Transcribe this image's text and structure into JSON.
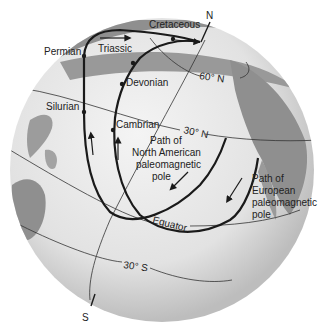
{
  "figure": {
    "type": "globe-polar-wander-diagram",
    "colors": {
      "ocean": "#e6e6e6",
      "land": "#8f8f8f",
      "grid_lines": "#333333",
      "paths": "#1a1a1a",
      "text": "#222222"
    }
  },
  "poles": {
    "north": "N",
    "south": "S"
  },
  "latitudes": {
    "lat60n": "60° N",
    "lat30n": "30° N",
    "equator": "Equator",
    "lat30s": "30° S"
  },
  "periods": {
    "cretaceous": "Cretaceous",
    "triassic": "Triassic",
    "permian": "Permian",
    "devonian": "Devonian",
    "silurian": "Silurian",
    "cambrian": "Cambrian"
  },
  "paths": {
    "north_american": {
      "line1": "Path of",
      "line2": "North American",
      "line3": "paleomagnetic",
      "line4": "pole"
    },
    "european": {
      "line1": "Path of",
      "line2": "European",
      "line3": "paleomagnetic",
      "line4": "pole"
    }
  }
}
